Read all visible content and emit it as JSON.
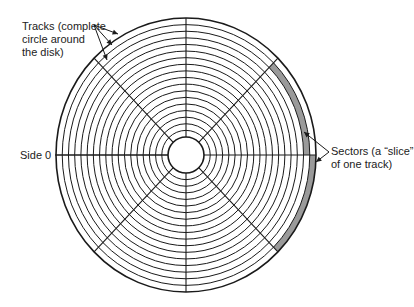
{
  "diagram": {
    "track_count": 18,
    "sector_count": 8,
    "labels": {
      "tracks": [
        "Tracks (complete",
        "circle around",
        "the disk)"
      ],
      "sectors": [
        "Sectors (a “slice”",
        "of one track)"
      ],
      "side": "Side 0"
    },
    "highlighted_sectors": [
      {
        "sector": "upper-right",
        "track_from_outside": 2
      },
      {
        "sector": "lower-right",
        "track_from_outside": 1
      }
    ],
    "colors": {
      "line": "#1a1a1a",
      "highlight": "#9a9a9a",
      "background": "#ffffff"
    }
  }
}
